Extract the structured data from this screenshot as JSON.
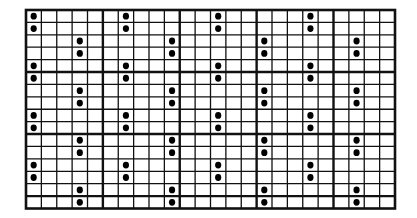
{
  "diagram": {
    "type": "dot-grid-pattern",
    "grid": {
      "columns": 24,
      "rows": 16,
      "major_every_columns": 5,
      "major_every_rows": 5
    },
    "colors": {
      "background": "#ffffff",
      "line": "#111111",
      "dot": "#000000"
    },
    "dots": [
      {
        "col": 0,
        "rows": [
          0,
          1,
          4,
          5,
          8,
          9,
          12,
          13
        ]
      },
      {
        "col": 3,
        "rows": [
          2,
          3,
          6,
          7,
          10,
          11,
          14,
          15
        ]
      },
      {
        "col": 6,
        "rows": [
          0,
          1,
          4,
          5,
          8,
          9,
          12,
          13
        ]
      },
      {
        "col": 9,
        "rows": [
          2,
          3,
          6,
          7,
          10,
          11,
          14,
          15
        ]
      },
      {
        "col": 12,
        "rows": [
          0,
          1,
          4,
          5,
          8,
          9,
          12,
          13
        ]
      },
      {
        "col": 15,
        "rows": [
          2,
          3,
          6,
          7,
          10,
          11,
          14,
          15
        ]
      },
      {
        "col": 18,
        "rows": [
          0,
          1,
          4,
          5,
          8,
          9,
          12,
          13
        ]
      },
      {
        "col": 21,
        "rows": [
          2,
          3,
          6,
          7,
          10,
          11,
          14,
          15
        ]
      }
    ]
  }
}
